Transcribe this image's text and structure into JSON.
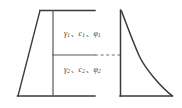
{
  "figure": {
    "stroke_color": "#3a3a3a",
    "dash_color": "#6e6e6e",
    "background": "#ffffff"
  },
  "labels": {
    "layer_1": {
      "gamma": "γ",
      "gamma_sub": "1",
      "cohesion": "c",
      "cohesion_sub": "1",
      "phi": "φ",
      "phi_sub": "1",
      "separator": "、",
      "full_text": "γ1、c1、φ1"
    },
    "layer_2": {
      "gamma": "γ",
      "gamma_sub": "2",
      "cohesion": "c",
      "cohesion_sub": "2",
      "phi": "φ",
      "phi_sub": "2",
      "separator": "、",
      "full_text": "γ2、c2、φ2"
    }
  },
  "geometry": {
    "left_figure": {
      "name": "retaining-wall-cross-section",
      "top_edge": {
        "x1": 40,
        "y1": 10,
        "x2": 95,
        "y2": 10
      },
      "bottom_edge": {
        "x1": 18,
        "y1": 96,
        "x2": 95,
        "y2": 96
      },
      "inclined_back_face": {
        "x1": 18,
        "y1": 96,
        "x2": 40,
        "y2": 10
      },
      "inner_vertical": {
        "x1": 53,
        "y1": 10,
        "x2": 53,
        "y2": 96
      },
      "layer_interface": {
        "x1": 53,
        "y1": 55,
        "x2": 95,
        "y2": 55
      }
    },
    "dashed_connector": {
      "x1": 95,
      "y1": 55,
      "x2": 122,
      "y2": 55
    },
    "right_figure": {
      "name": "earth-pressure-diagram",
      "vertical_axis": {
        "x1": 120,
        "y1": 10,
        "x2": 120,
        "y2": 96
      },
      "baseline": {
        "x1": 120,
        "y1": 96,
        "x2": 172,
        "y2": 96
      },
      "pressure_curve_points": [
        {
          "x": 121,
          "y": 11
        },
        {
          "x": 130,
          "y": 34
        },
        {
          "x": 137,
          "y": 50
        },
        {
          "x": 140,
          "y": 57
        },
        {
          "x": 152,
          "y": 75
        },
        {
          "x": 172,
          "y": 96
        }
      ],
      "kink_at_interface": {
        "x": 140,
        "y": 57
      }
    }
  }
}
